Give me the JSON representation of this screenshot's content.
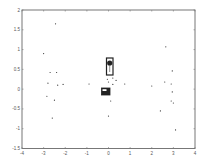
{
  "chart_data": {
    "type": "scatter",
    "title": "",
    "xlabel": "",
    "ylabel": "",
    "xlim": [
      -4,
      4
    ],
    "ylim": [
      -1.5,
      2
    ],
    "grid": false,
    "legend": null,
    "x_ticks": [
      -4,
      -3,
      -2,
      -1,
      0,
      1,
      2,
      3,
      4
    ],
    "y_ticks": [
      -1.5,
      -1,
      -0.5,
      0,
      0.5,
      1,
      1.5,
      2
    ],
    "x_tick_labels": [
      "-4",
      "-3",
      "-2",
      "-1",
      "0",
      "1",
      "2",
      "3",
      "4"
    ],
    "y_tick_labels": [
      "-1.5",
      "-1",
      "-0.5",
      "0",
      "0.5",
      "1",
      "1.5",
      "2"
    ],
    "series": [
      {
        "name": "points",
        "marker": "dot",
        "color": "#333333",
        "points": [
          [
            -2.45,
            1.65
          ],
          [
            -3.0,
            0.9
          ],
          [
            -2.7,
            0.42
          ],
          [
            -2.4,
            0.42
          ],
          [
            -2.8,
            0.15
          ],
          [
            -2.35,
            0.1
          ],
          [
            -2.1,
            0.12
          ],
          [
            -2.85,
            -0.18
          ],
          [
            -2.5,
            -0.28
          ],
          [
            -2.6,
            -0.73
          ],
          [
            -0.9,
            0.13
          ],
          [
            -0.05,
            0.25
          ],
          [
            0.2,
            0.28
          ],
          [
            0.0,
            0.18
          ],
          [
            0.2,
            0.12
          ],
          [
            0.35,
            0.22
          ],
          [
            0.75,
            0.13
          ],
          [
            0.1,
            -0.3
          ],
          [
            0.0,
            -0.68
          ],
          [
            2.65,
            1.07
          ],
          [
            2.95,
            0.46
          ],
          [
            2.0,
            0.08
          ],
          [
            2.6,
            0.18
          ],
          [
            2.9,
            0.13
          ],
          [
            2.95,
            -0.07
          ],
          [
            2.9,
            -0.3
          ],
          [
            3.0,
            -0.35
          ],
          [
            2.4,
            -0.55
          ],
          [
            3.1,
            -1.03
          ]
        ]
      }
    ],
    "annotations": [
      {
        "type": "rectangle",
        "label": "upper-object",
        "x_range": [
          -0.15,
          0.2
        ],
        "y_range": [
          0.35,
          0.8
        ],
        "fill": "none",
        "marker": "filled-circle-top"
      },
      {
        "type": "rectangle",
        "label": "lower-object",
        "x_range": [
          -0.3,
          0.1
        ],
        "y_range": [
          -0.15,
          0.02
        ],
        "fill": "#222222"
      }
    ]
  },
  "colors": {
    "axis": "#777777",
    "points": "#333333",
    "objects": "#222222"
  }
}
